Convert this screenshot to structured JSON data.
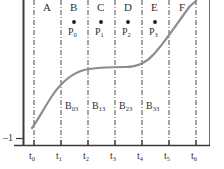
{
  "figure": {
    "name": "bezier-spline-knot-diagram",
    "colors": {
      "curve": "#8d8d8d",
      "axis": "#3a3a3a",
      "divider": "#4a4a4a",
      "text": "#2f2f2f",
      "point": "#1a1a1a",
      "background": "#ffffff"
    }
  },
  "axes": {
    "y_tick_label": "–1",
    "x_ticks": [
      {
        "name": "t0",
        "base": "t",
        "sub": "0",
        "x": 34
      },
      {
        "name": "t1",
        "base": "t",
        "sub": "1",
        "x": 61
      },
      {
        "name": "t2",
        "base": "t",
        "sub": "2",
        "x": 88
      },
      {
        "name": "t3",
        "base": "t",
        "sub": "3",
        "x": 115
      },
      {
        "name": "t4",
        "base": "t",
        "sub": "4",
        "x": 142
      },
      {
        "name": "t5",
        "base": "t",
        "sub": "5",
        "x": 169
      },
      {
        "name": "t6",
        "base": "t",
        "sub": "6",
        "x": 196
      }
    ]
  },
  "segments": [
    {
      "label": "A",
      "center": 47
    },
    {
      "label": "B",
      "center": 74
    },
    {
      "label": "C",
      "center": 101
    },
    {
      "label": "D",
      "center": 128
    },
    {
      "label": "E",
      "center": 155
    },
    {
      "label": "F",
      "center": 182
    }
  ],
  "control_points": [
    {
      "base": "P",
      "sub": "0",
      "x": 74,
      "y": 22
    },
    {
      "base": "P",
      "sub": "1",
      "x": 101,
      "y": 22
    },
    {
      "base": "P",
      "sub": "2",
      "x": 128,
      "y": 22
    },
    {
      "base": "P",
      "sub": "3",
      "x": 155,
      "y": 22
    }
  ],
  "basis_labels": [
    {
      "base": "B",
      "sub": "03",
      "x": 74,
      "y": 107
    },
    {
      "base": "B",
      "sub": "13",
      "x": 101,
      "y": 107
    },
    {
      "base": "B",
      "sub": "23",
      "x": 128,
      "y": 107
    },
    {
      "base": "B",
      "sub": "33",
      "x": 155,
      "y": 107
    }
  ],
  "curve": {
    "type": "cubic-spline",
    "path": "M 32,128 C 38,120 44,108 52,96 C 60,84 70,74 84,70 C 96,67 112,67 126,67 C 136,67 146,63 154,54 C 166,41 178,22 190,6 L 196,1"
  }
}
